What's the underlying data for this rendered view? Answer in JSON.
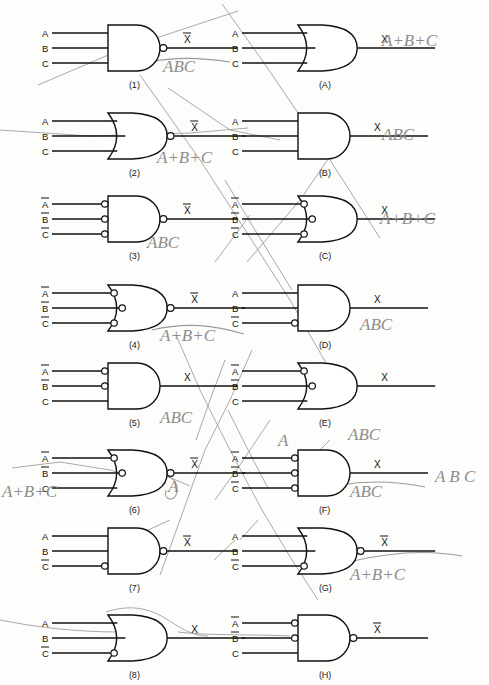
{
  "page": {
    "background_color": "#fdfdfc",
    "ink_color": "#111111",
    "pencil_color": "#8d8d8d"
  },
  "gates": [
    {
      "id": "1",
      "label": "(1)",
      "shape": "and",
      "output_bubble": true,
      "output_label": "X",
      "output_overline": true,
      "inputs": [
        {
          "label": "A",
          "overline": false,
          "bubble": false
        },
        {
          "label": "B",
          "overline": false,
          "bubble": false
        },
        {
          "label": "C",
          "overline": false,
          "bubble": false
        }
      ]
    },
    {
      "id": "A",
      "label": "(A)",
      "shape": "or",
      "output_bubble": false,
      "output_label": "X",
      "output_overline": false,
      "inputs": [
        {
          "label": "A",
          "overline": false,
          "bubble": false
        },
        {
          "label": "B",
          "overline": false,
          "bubble": false
        },
        {
          "label": "C",
          "overline": false,
          "bubble": false
        }
      ]
    },
    {
      "id": "2",
      "label": "(2)",
      "shape": "or",
      "output_bubble": true,
      "output_label": "X",
      "output_overline": true,
      "inputs": [
        {
          "label": "A",
          "overline": false,
          "bubble": false
        },
        {
          "label": "B",
          "overline": false,
          "bubble": false
        },
        {
          "label": "C",
          "overline": false,
          "bubble": false
        }
      ]
    },
    {
      "id": "B",
      "label": "(B)",
      "shape": "and",
      "output_bubble": false,
      "output_label": "X",
      "output_overline": false,
      "inputs": [
        {
          "label": "A",
          "overline": false,
          "bubble": false
        },
        {
          "label": "B",
          "overline": false,
          "bubble": false
        },
        {
          "label": "C",
          "overline": false,
          "bubble": false
        }
      ]
    },
    {
      "id": "3",
      "label": "(3)",
      "shape": "and",
      "output_bubble": true,
      "output_label": "X",
      "output_overline": true,
      "inputs": [
        {
          "label": "A",
          "overline": true,
          "bubble": true
        },
        {
          "label": "B",
          "overline": true,
          "bubble": true
        },
        {
          "label": "C",
          "overline": true,
          "bubble": true
        }
      ]
    },
    {
      "id": "C",
      "label": "(C)",
      "shape": "or",
      "output_bubble": false,
      "output_label": "X",
      "output_overline": false,
      "inputs": [
        {
          "label": "A",
          "overline": true,
          "bubble": true
        },
        {
          "label": "B",
          "overline": true,
          "bubble": true
        },
        {
          "label": "C",
          "overline": true,
          "bubble": true
        }
      ]
    },
    {
      "id": "4",
      "label": "(4)",
      "shape": "or",
      "output_bubble": true,
      "output_label": "X",
      "output_overline": true,
      "inputs": [
        {
          "label": "A",
          "overline": true,
          "bubble": true
        },
        {
          "label": "B",
          "overline": true,
          "bubble": true
        },
        {
          "label": "C",
          "overline": true,
          "bubble": true
        }
      ]
    },
    {
      "id": "D",
      "label": "(D)",
      "shape": "and",
      "output_bubble": false,
      "output_label": "X",
      "output_overline": false,
      "inputs": [
        {
          "label": "A",
          "overline": false,
          "bubble": false
        },
        {
          "label": "B",
          "overline": false,
          "bubble": false
        },
        {
          "label": "C",
          "overline": true,
          "bubble": true
        }
      ]
    },
    {
      "id": "5",
      "label": "(5)",
      "shape": "and",
      "output_bubble": false,
      "output_label": "X",
      "output_overline": false,
      "inputs": [
        {
          "label": "A",
          "overline": true,
          "bubble": true
        },
        {
          "label": "B",
          "overline": true,
          "bubble": true
        },
        {
          "label": "C",
          "overline": false,
          "bubble": false
        }
      ]
    },
    {
      "id": "E",
      "label": "(E)",
      "shape": "or",
      "output_bubble": false,
      "output_label": "X",
      "output_overline": false,
      "inputs": [
        {
          "label": "A",
          "overline": true,
          "bubble": true
        },
        {
          "label": "B",
          "overline": true,
          "bubble": true
        },
        {
          "label": "C",
          "overline": false,
          "bubble": false
        }
      ]
    },
    {
      "id": "6",
      "label": "(6)",
      "shape": "or",
      "output_bubble": true,
      "output_label": "X",
      "output_overline": true,
      "inputs": [
        {
          "label": "A",
          "overline": true,
          "bubble": true
        },
        {
          "label": "B",
          "overline": true,
          "bubble": true
        },
        {
          "label": "C",
          "overline": false,
          "bubble": false
        }
      ]
    },
    {
      "id": "F",
      "label": "(F)",
      "shape": "and",
      "output_bubble": false,
      "output_label": "X",
      "output_overline": false,
      "inputs": [
        {
          "label": "A",
          "overline": true,
          "bubble": true
        },
        {
          "label": "B",
          "overline": true,
          "bubble": true
        },
        {
          "label": "C",
          "overline": true,
          "bubble": true
        }
      ]
    },
    {
      "id": "7",
      "label": "(7)",
      "shape": "and",
      "output_bubble": true,
      "output_label": "X",
      "output_overline": true,
      "inputs": [
        {
          "label": "A",
          "overline": false,
          "bubble": false
        },
        {
          "label": "B",
          "overline": false,
          "bubble": false
        },
        {
          "label": "C",
          "overline": true,
          "bubble": true
        }
      ]
    },
    {
      "id": "G",
      "label": "(G)",
      "shape": "or",
      "output_bubble": true,
      "output_label": "X",
      "output_overline": true,
      "inputs": [
        {
          "label": "A",
          "overline": false,
          "bubble": false
        },
        {
          "label": "B",
          "overline": false,
          "bubble": false
        },
        {
          "label": "C",
          "overline": true,
          "bubble": true
        }
      ]
    },
    {
      "id": "8",
      "label": "(8)",
      "shape": "or",
      "output_bubble": false,
      "output_label": "X",
      "output_overline": false,
      "inputs": [
        {
          "label": "A",
          "overline": false,
          "bubble": false
        },
        {
          "label": "B",
          "overline": false,
          "bubble": false
        },
        {
          "label": "C",
          "overline": true,
          "bubble": true
        }
      ]
    },
    {
      "id": "H",
      "label": "(H)",
      "shape": "and",
      "output_bubble": true,
      "output_label": "X",
      "output_overline": true,
      "inputs": [
        {
          "label": "A",
          "overline": true,
          "bubble": true
        },
        {
          "label": "B",
          "overline": true,
          "bubble": true
        },
        {
          "label": "C",
          "overline": false,
          "bubble": false
        }
      ]
    }
  ],
  "annotations": [
    {
      "name": "note-abc-gate1",
      "text": "ABC",
      "x": 163,
      "y": 72,
      "size": 17
    },
    {
      "name": "note-apbpc-gate2",
      "text": "A+B+C",
      "x": 157,
      "y": 163,
      "size": 17
    },
    {
      "name": "note-abc-gate3",
      "text": "ABC",
      "x": 147,
      "y": 248,
      "size": 17
    },
    {
      "name": "note-apbpc-gate4",
      "text": "A+B+C",
      "x": 160,
      "y": 341,
      "size": 17
    },
    {
      "name": "note-abc-gate5",
      "text": "ABC",
      "x": 160,
      "y": 423,
      "size": 17
    },
    {
      "name": "note-apbpc-gate6",
      "text": "A+B+C",
      "x": 2,
      "y": 497,
      "size": 17
    },
    {
      "name": "note-a-gate6",
      "text": "A",
      "x": 168,
      "y": 492,
      "size": 18
    },
    {
      "name": "note-apbpc-gateA",
      "text": "A+B+C",
      "x": 382,
      "y": 46,
      "size": 18
    },
    {
      "name": "note-abc-gateB",
      "text": "ABC",
      "x": 382,
      "y": 140,
      "size": 19
    },
    {
      "name": "note-apbpc-gateC",
      "text": "A+B+C",
      "x": 380,
      "y": 224,
      "size": 18
    },
    {
      "name": "note-abc-gateD",
      "text": "ABC",
      "x": 360,
      "y": 330,
      "size": 17
    },
    {
      "name": "note-a-gateE",
      "text": "A",
      "x": 278,
      "y": 446,
      "size": 17
    },
    {
      "name": "note-abc-gateE",
      "text": "ABC",
      "x": 348,
      "y": 440,
      "size": 13
    },
    {
      "name": "note-abc-gateF",
      "text": "ABC",
      "x": 350,
      "y": 497,
      "size": 18
    },
    {
      "name": "note-abarbbarcbar",
      "text": "A B C",
      "x": 435,
      "y": 482,
      "size": 14
    },
    {
      "name": "note-apbpc-gateG",
      "text": "A+B+C",
      "x": 350,
      "y": 580,
      "size": 18
    }
  ]
}
